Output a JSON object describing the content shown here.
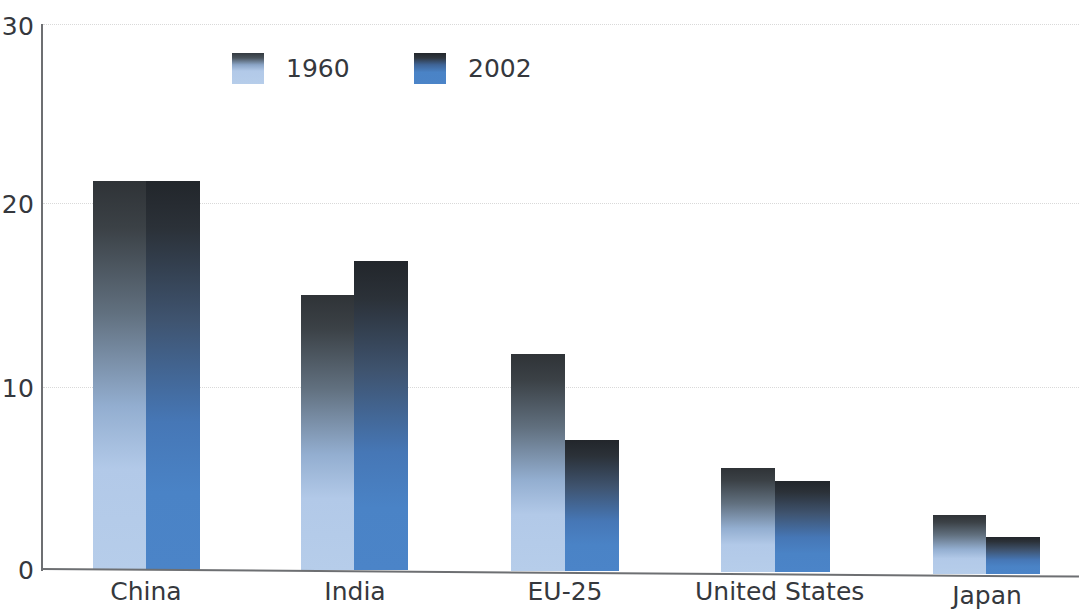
{
  "chart_data": {
    "type": "bar",
    "title": "",
    "subtitle": "",
    "xlabel": "",
    "ylabel": "",
    "categories": [
      "China",
      "India",
      "EU-25",
      "United States",
      "Japan"
    ],
    "series": [
      {
        "name": "1960",
        "color": "#b6cdea",
        "values": [
          21.4,
          15.1,
          11.9,
          5.6,
          3.0
        ]
      },
      {
        "name": "2002",
        "color": "#4b84c8",
        "values": [
          21.4,
          17.0,
          7.2,
          4.9,
          1.8
        ]
      }
    ],
    "ylim": [
      0,
      30
    ],
    "yticks": [
      0,
      10,
      20,
      30
    ],
    "ytick_labels": [
      "0",
      "10",
      "20",
      "30"
    ],
    "grid": "horizontal-dotted",
    "legend_position": "top-left-inside",
    "annotations": []
  },
  "axis": {
    "y_ticks": [
      {
        "label": "30",
        "value": 30
      },
      {
        "label": "20",
        "value": 20
      },
      {
        "label": "10",
        "value": 10
      },
      {
        "label": "0",
        "value": 0
      }
    ],
    "x_categories": [
      {
        "label": "China"
      },
      {
        "label": "India"
      },
      {
        "label": "EU-25"
      },
      {
        "label": "United States"
      },
      {
        "label": "Japan"
      }
    ]
  },
  "legend": {
    "entries": [
      {
        "label": "1960",
        "color": "#b6cdea"
      },
      {
        "label": "2002",
        "color": "#4b84c8"
      }
    ]
  },
  "colors": {
    "series_1960": "#b6cdea",
    "series_2002": "#4b84c8",
    "axis": "#6d6f72",
    "gridline": "#d9d9d9",
    "text": "#35383d",
    "background": "#ffffff"
  }
}
